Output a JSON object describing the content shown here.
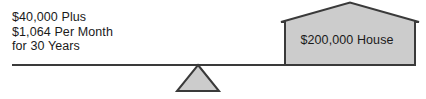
{
  "diagram": {
    "left_side": {
      "name": "payment-cost",
      "lines": [
        "$40,000 Plus",
        "$1,064 Per Month",
        "for 30 Years"
      ]
    },
    "right_side": {
      "name": "house-value",
      "label": "$200,000 House"
    },
    "fulcrum": {
      "name": "fulcrum-triangle"
    },
    "colors": {
      "fill": "#cccccc",
      "stroke": "#3a3a3a",
      "beam": "#3a3a3a",
      "text": "#1a1a1a",
      "background": "#ffffff"
    }
  }
}
